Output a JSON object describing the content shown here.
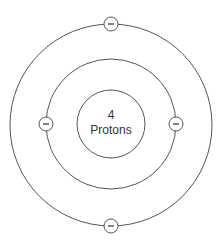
{
  "diagram": {
    "nucleus": {
      "count": "4",
      "label": "Protons"
    },
    "shells": [
      {
        "name": "inner",
        "electrons": 2
      },
      {
        "name": "outer",
        "electrons": 2
      }
    ],
    "electron_symbol": "−",
    "colors": {
      "stroke": "#555555",
      "text": "#333333",
      "background": "#ffffff"
    }
  }
}
